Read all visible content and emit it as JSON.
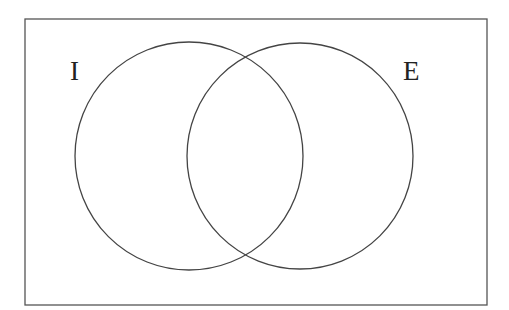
{
  "diagram": {
    "type": "venn",
    "universe": {
      "x": 25,
      "y": 19,
      "width": 462,
      "height": 286,
      "stroke": "#555555"
    },
    "sets": [
      {
        "label": "I",
        "cx": 189,
        "cy": 156,
        "r": 114,
        "label_x": 70,
        "label_y": 80
      },
      {
        "label": "E",
        "cx": 300,
        "cy": 156,
        "r": 113,
        "label_x": 403,
        "label_y": 80
      }
    ],
    "stroke_color": "#444444"
  }
}
